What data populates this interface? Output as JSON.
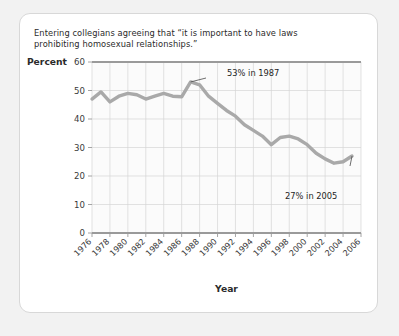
{
  "card": {
    "title_line1": "Entering collegians agreeing that “it is important to have laws",
    "title_line2": "prohibiting homosexual relationships.”"
  },
  "chart_data": {
    "type": "line",
    "title": "Entering collegians agreeing that “it is important to have laws prohibiting homosexual relationships.”",
    "xlabel": "Year",
    "ylabel": "Percent",
    "xlim": [
      1976,
      2006
    ],
    "ylim": [
      0,
      60
    ],
    "ytick_labels": [
      "0",
      "10",
      "20",
      "30",
      "40",
      "50",
      "60"
    ],
    "yticks": [
      0,
      10,
      20,
      30,
      40,
      50,
      60
    ],
    "xtick_labels": [
      "1976",
      "1978",
      "1980",
      "1982",
      "1984",
      "1986",
      "1988",
      "1990",
      "1992",
      "1994",
      "1996",
      "1998",
      "2000",
      "2002",
      "2004",
      "2006"
    ],
    "xticks": [
      1976,
      1978,
      1980,
      1982,
      1984,
      1986,
      1988,
      1990,
      1992,
      1994,
      1996,
      1998,
      2000,
      2002,
      2004,
      2006
    ],
    "grid": true,
    "legend": "none",
    "line_color": "#a9a9a9",
    "x": [
      1976,
      1977,
      1978,
      1979,
      1980,
      1981,
      1982,
      1983,
      1984,
      1985,
      1986,
      1987,
      1988,
      1989,
      1990,
      1991,
      1992,
      1993,
      1994,
      1995,
      1996,
      1997,
      1998,
      1999,
      2000,
      2001,
      2002,
      2003,
      2004,
      2005
    ],
    "values": [
      47,
      49.5,
      46,
      48,
      49,
      48.5,
      47,
      48,
      49,
      48,
      47.8,
      53,
      52,
      48,
      45.5,
      43,
      41,
      38,
      36,
      34,
      31,
      33.5,
      34,
      33,
      31,
      28,
      26,
      24.5,
      25,
      27
    ],
    "annotations": [
      {
        "label": "53% in 1987",
        "x": 1987,
        "y": 53
      },
      {
        "label": "27% in 2005",
        "x": 2005,
        "y": 27
      }
    ]
  }
}
